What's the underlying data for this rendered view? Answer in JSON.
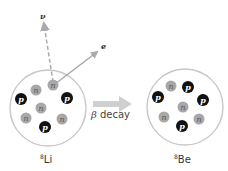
{
  "diagram": {
    "colors": {
      "proton": "#111111",
      "neutron": "#a8a8a8",
      "nucleus_outline": "#c8c8c8",
      "arrow": "#aaaaaa",
      "decay_arrow": "#cfcfcf"
    },
    "particles": {
      "proton_symbol": "p",
      "neutron_symbol": "n",
      "electron_symbol": "e",
      "neutrino_symbol": "ν"
    },
    "parent": {
      "mass_number": "8",
      "element": "Li",
      "protons": 3,
      "neutrons": 5
    },
    "daughter": {
      "mass_number": "8",
      "element": "Be",
      "protons": 4,
      "neutrons": 4
    },
    "process": {
      "greek": "β",
      "label": " decay"
    }
  }
}
